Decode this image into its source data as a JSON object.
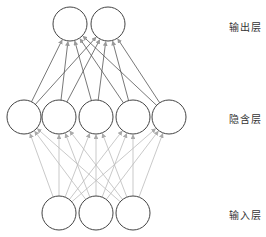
{
  "diagram": {
    "title": "",
    "colors": {
      "node_stroke": "#444444",
      "hidden_to_output_edge": "#555555",
      "input_to_hidden_edge": "#bbbbbb",
      "arrow_out": "#999999",
      "arrow_in": "#aaaaaa"
    },
    "layers": [
      {
        "name": "输出层",
        "nodes": 2
      },
      {
        "name": "隐含层",
        "nodes": 5
      },
      {
        "name": "输入层",
        "nodes": 3
      }
    ],
    "labels": {
      "output": "输出层",
      "hidden": "隐含层",
      "input": "输入层"
    },
    "connections": "fully-connected, input→hidden (light gray arrows), hidden→output (dark lines with gray arrows)"
  }
}
